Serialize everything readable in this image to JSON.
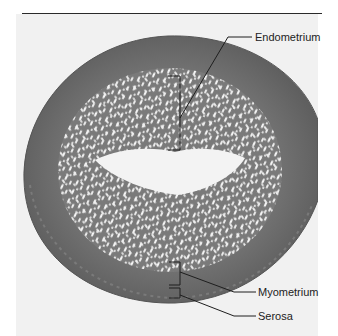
{
  "figure": {
    "colors": {
      "background": "#ffffff",
      "photo_background": "#f1f1f1",
      "myometrium": "#6e6e6e",
      "myometrium_edge": "#5f5f5f",
      "endometrium": "#7a7a7a",
      "glands": "#f4f4f4",
      "lumen": "#f3f3f3",
      "leader_line": "#1e1e1e"
    }
  },
  "labels": {
    "endometrium": "Endometrium",
    "myometrium": "Myometrium",
    "serosa": "Serosa"
  }
}
